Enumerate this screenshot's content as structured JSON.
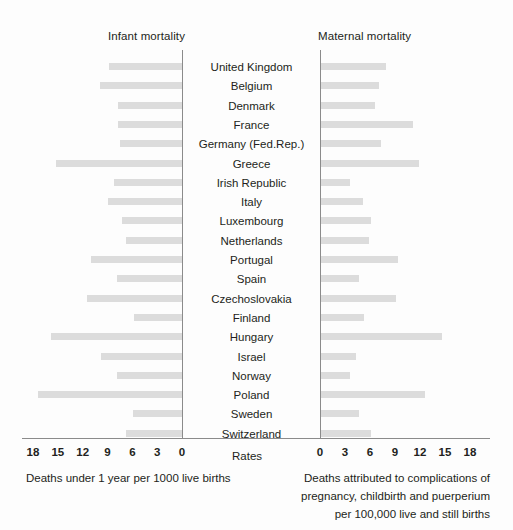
{
  "figure": {
    "left_panel_title": "Infant mortality",
    "right_panel_title": "Maternal mortality",
    "center_axis_label": "Rates",
    "left_caption_lines": [
      "Deaths under 1 year per 1000 live births"
    ],
    "right_caption_lines": [
      "Deaths attributed to complications of",
      "pregnancy, childbirth and puerperium",
      "per 100,000 live and still births"
    ],
    "bar_color": "#dcdcdc",
    "axis_color": "#8b8b8b",
    "text_color": "#231f20"
  },
  "axes": {
    "left_ticks": [
      "18",
      "15",
      "12",
      "9",
      "6",
      "3",
      "0"
    ],
    "right_ticks": [
      "0",
      "3",
      "6",
      "9",
      "12",
      "15",
      "18"
    ],
    "left_min": 0,
    "left_max": 18,
    "right_min": 0,
    "right_max": 18
  },
  "chart_data": {
    "type": "bar",
    "subtype": "diverging-horizontal-bar",
    "xlabel": "Rates",
    "ylabel": "",
    "categories": [
      "United Kingdom",
      "Belgium",
      "Denmark",
      "France",
      "Germany (Fed.Rep.)",
      "Greece",
      "Irish Republic",
      "Italy",
      "Luxembourg",
      "Netherlands",
      "Portugal",
      "Spain",
      "Czechoslovakia",
      "Finland",
      "Hungary",
      "Israel",
      "Norway",
      "Poland",
      "Sweden",
      "Switzerland"
    ],
    "series": [
      {
        "name": "Infant mortality",
        "axis": "left",
        "direction": "left",
        "units": "Deaths under 1 year per 1000 live births",
        "xlim": [
          0,
          18
        ],
        "values": [
          8.8,
          9.9,
          7.7,
          7.7,
          7.5,
          15.2,
          8.2,
          9.0,
          7.2,
          6.8,
          11.0,
          7.8,
          11.5,
          5.8,
          15.8,
          9.8,
          7.9,
          17.4,
          5.9,
          6.8
        ]
      },
      {
        "name": "Maternal mortality",
        "axis": "right",
        "direction": "right",
        "units": "Deaths attributed to complications of pregnancy, childbirth and puerperium per 100,000 live and still births",
        "xlim": [
          0,
          18
        ],
        "values": [
          7.8,
          7.0,
          6.5,
          11.0,
          7.2,
          11.8,
          3.5,
          5.0,
          6.0,
          5.8,
          9.2,
          4.5,
          9.0,
          5.2,
          14.5,
          4.2,
          3.5,
          12.5,
          4.5,
          6.0
        ]
      }
    ],
    "grid": false,
    "legend_position": "top"
  }
}
